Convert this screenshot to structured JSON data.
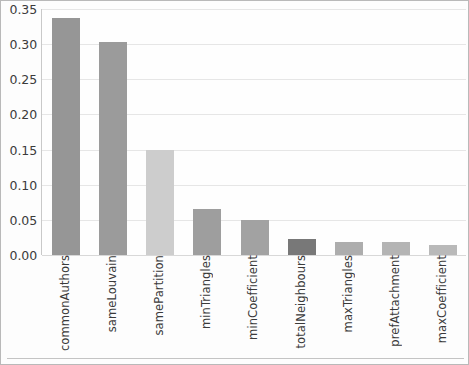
{
  "chart_data": {
    "type": "bar",
    "title": "",
    "xlabel": "",
    "ylabel": "",
    "categories": [
      "commonAuthors",
      "sameLouvain",
      "samePartition",
      "minTriangles",
      "minCoefficient",
      "totalNeighbours",
      "maxTriangles",
      "prefAttachment",
      "maxCoefficient"
    ],
    "values": [
      0.337,
      0.303,
      0.149,
      0.066,
      0.05,
      0.023,
      0.018,
      0.018,
      0.014
    ],
    "bar_colors": [
      "#969696",
      "#9b9b9b",
      "#cdcdcd",
      "#9e9e9e",
      "#a2a2a2",
      "#787878",
      "#adadad",
      "#b4b4b4",
      "#b9b9b9"
    ],
    "ylim": [
      0.0,
      0.35
    ],
    "ytick_labels": [
      "0.35",
      "0.30",
      "0.25",
      "0.20",
      "0.15",
      "0.10",
      "0.05",
      "0.00"
    ],
    "ytick_values": [
      0.35,
      0.3,
      0.25,
      0.2,
      0.15,
      0.1,
      0.05,
      0.0
    ],
    "grid": true,
    "legend": "none",
    "background_color": "#fdfdfd",
    "border_color": "#b9b9b9",
    "gridline_color": "#e6e6e6"
  }
}
